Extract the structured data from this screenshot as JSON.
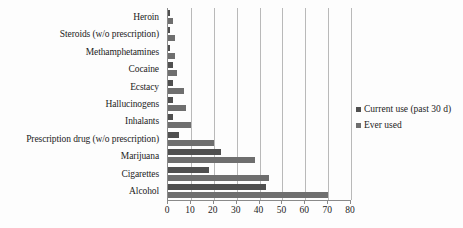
{
  "chart_data": {
    "type": "bar",
    "orientation": "horizontal",
    "title": "",
    "xlabel": "",
    "ylabel": "",
    "xlim": [
      0,
      80
    ],
    "xticks": [
      0,
      10,
      20,
      30,
      40,
      50,
      60,
      70,
      80
    ],
    "grid": true,
    "legend_position": "right",
    "categories": [
      "Heroin",
      "Steroids (w/o prescription)",
      "Methamphetamines",
      "Cocaine",
      "Ecstacy",
      "Hallucinogens",
      "Inhalants",
      "Prescription drug (w/o prescription)",
      "Marijuana",
      "Cigarettes",
      "Alcohol"
    ],
    "series": [
      {
        "name": "Current use (past 30 d)",
        "color": "#4f4f4f",
        "values": [
          1,
          1,
          1,
          2,
          2,
          2,
          2,
          5,
          23,
          18,
          43
        ]
      },
      {
        "name": "Ever used",
        "color": "#6e6e6e",
        "values": [
          2,
          3,
          3,
          4,
          7,
          8,
          10,
          20,
          38,
          44,
          70
        ]
      }
    ]
  },
  "legend": {
    "items": [
      {
        "label": "Current use (past 30 d)"
      },
      {
        "label": "Ever used"
      }
    ]
  },
  "axis": {
    "tick_labels": [
      "0",
      "10",
      "20",
      "30",
      "40",
      "50",
      "60",
      "70",
      "80"
    ]
  }
}
